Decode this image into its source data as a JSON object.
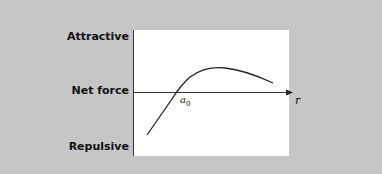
{
  "diagram": {
    "type": "force-vs-distance curve",
    "y_labels": {
      "top": "Attractive",
      "middle": "Net force",
      "bottom": "Repulsive"
    },
    "x_axis_label": "r",
    "crossing_label": "a",
    "crossing_subscript": "0",
    "colors": {
      "background": "#c6c6c6",
      "panel": "#ffffff",
      "line": "#222222"
    }
  }
}
